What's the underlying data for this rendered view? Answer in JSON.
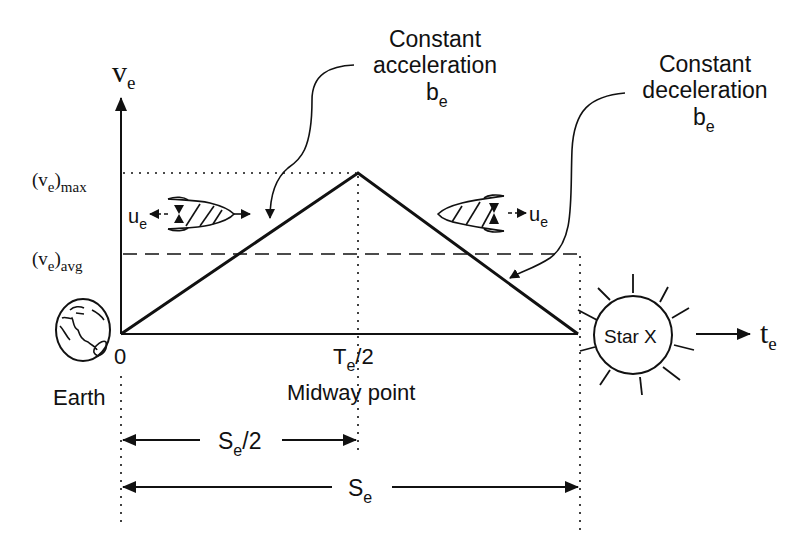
{
  "diagram": {
    "y_axis": {
      "label_main": "v",
      "label_sub": "e"
    },
    "x_axis": {
      "label_main": "t",
      "label_sub": "e"
    },
    "levels": {
      "max": {
        "open": "(v",
        "sub": "e",
        "close": ")",
        "tail": "max"
      },
      "avg": {
        "open": "(v",
        "sub": "e",
        "close": ")",
        "tail": "avg"
      }
    },
    "ticks": {
      "origin": "0",
      "midpoint_main": "T",
      "midpoint_sub": "e",
      "midpoint_tail": "/2",
      "midpoint_caption": "Midway point"
    },
    "annotations": {
      "acceleration": {
        "line1": "Constant",
        "line2": "acceleration",
        "symbol": "b",
        "symbol_sub": "e"
      },
      "deceleration": {
        "line1": "Constant",
        "line2": "deceleration",
        "symbol": "b",
        "symbol_sub": "e"
      }
    },
    "rockets": {
      "outbound": {
        "label": "u",
        "label_sub": "e",
        "direction": "right-thrust-left"
      },
      "inbound": {
        "label": "u",
        "label_sub": "e",
        "direction": "left-thrust-right"
      }
    },
    "bodies": {
      "origin": {
        "name": "Earth",
        "icon": "earth-globe-icon"
      },
      "destination": {
        "name": "Star X",
        "icon": "star-sun-icon"
      }
    },
    "distances": {
      "half": {
        "main": "S",
        "sub": "e",
        "tail": "/2"
      },
      "full": {
        "main": "S",
        "sub": "e",
        "tail": ""
      }
    },
    "colors": {
      "ink": "#111111",
      "background": "#ffffff"
    }
  }
}
